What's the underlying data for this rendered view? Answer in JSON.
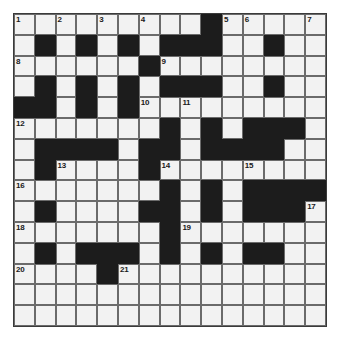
{
  "puzzle": {
    "type": "crossword-grid",
    "rows": 15,
    "columns": 15,
    "cell_size_px": 20.8,
    "grid_origin_px": {
      "x": 13,
      "y": 13
    },
    "colors": {
      "white_cell": "#f2f2f2",
      "black_cell": "#1c1c1c",
      "grid_line": "#6b6b6b",
      "border": "#3a3a3a",
      "number_text": "#1a1a1a",
      "page_background": "#ffffff"
    },
    "grid": [
      [
        "white",
        "white",
        "white",
        "white",
        "white",
        "white",
        "white",
        "white",
        "white",
        "black",
        "white",
        "white",
        "white",
        "white",
        "white"
      ],
      [
        "white",
        "black",
        "white",
        "black",
        "white",
        "black",
        "white",
        "black",
        "black",
        "black",
        "white",
        "white",
        "black",
        "white",
        "white"
      ],
      [
        "white",
        "white",
        "white",
        "white",
        "white",
        "white",
        "black",
        "white",
        "white",
        "white",
        "white",
        "white",
        "white",
        "white",
        "white"
      ],
      [
        "white",
        "black",
        "white",
        "black",
        "white",
        "black",
        "white",
        "black",
        "black",
        "black",
        "white",
        "white",
        "black",
        "white",
        "white"
      ],
      [
        "black",
        "black",
        "white",
        "black",
        "white",
        "black",
        "white",
        "white",
        "white",
        "white",
        "white",
        "white",
        "white",
        "white",
        "white"
      ],
      [
        "white",
        "white",
        "white",
        "white",
        "white",
        "white",
        "white",
        "black",
        "white",
        "black",
        "white",
        "black",
        "black",
        "black",
        "white"
      ],
      [
        "white",
        "black",
        "black",
        "black",
        "black",
        "white",
        "black",
        "black",
        "white",
        "black",
        "black",
        "black",
        "black",
        "white",
        "white"
      ],
      [
        "white",
        "black",
        "white",
        "white",
        "white",
        "white",
        "black",
        "white",
        "white",
        "white",
        "white",
        "white",
        "white",
        "white",
        "white"
      ],
      [
        "white",
        "white",
        "white",
        "white",
        "white",
        "white",
        "white",
        "black",
        "white",
        "black",
        "white",
        "black",
        "black",
        "black",
        "black"
      ],
      [
        "white",
        "black",
        "white",
        "white",
        "white",
        "white",
        "black",
        "black",
        "white",
        "black",
        "white",
        "black",
        "black",
        "black",
        "white"
      ],
      [
        "white",
        "white",
        "white",
        "white",
        "white",
        "white",
        "white",
        "black",
        "white",
        "white",
        "white",
        "white",
        "white",
        "white",
        "white"
      ],
      [
        "white",
        "black",
        "white",
        "black",
        "black",
        "black",
        "white",
        "black",
        "white",
        "black",
        "white",
        "black",
        "black",
        "white",
        "white"
      ],
      [
        "white",
        "white",
        "white",
        "white",
        "black",
        "white",
        "white",
        "white",
        "white",
        "white",
        "white",
        "white",
        "white",
        "white",
        "white"
      ],
      [
        "white",
        "white",
        "white",
        "white",
        "white",
        "white",
        "white",
        "white",
        "white",
        "white",
        "white",
        "white",
        "white",
        "white",
        "white"
      ],
      [
        "white",
        "white",
        "white",
        "white",
        "white",
        "white",
        "white",
        "white",
        "white",
        "white",
        "white",
        "white",
        "white",
        "white",
        "white"
      ]
    ],
    "numbers": [
      {
        "label": "1",
        "row": 0,
        "col": 0
      },
      {
        "label": "2",
        "row": 0,
        "col": 2
      },
      {
        "label": "3",
        "row": 0,
        "col": 4
      },
      {
        "label": "4",
        "row": 0,
        "col": 6
      },
      {
        "label": "5",
        "row": 0,
        "col": 10
      },
      {
        "label": "6",
        "row": 0,
        "col": 11
      },
      {
        "label": "7",
        "row": 0,
        "col": 14
      },
      {
        "label": "8",
        "row": 2,
        "col": 0
      },
      {
        "label": "9",
        "row": 2,
        "col": 7
      },
      {
        "label": "10",
        "row": 4,
        "col": 6
      },
      {
        "label": "11",
        "row": 4,
        "col": 8
      },
      {
        "label": "12",
        "row": 5,
        "col": 0
      },
      {
        "label": "13",
        "row": 7,
        "col": 2
      },
      {
        "label": "14",
        "row": 7,
        "col": 7
      },
      {
        "label": "15",
        "row": 7,
        "col": 11
      },
      {
        "label": "16",
        "row": 8,
        "col": 0
      },
      {
        "label": "17",
        "row": 9,
        "col": 14
      },
      {
        "label": "18",
        "row": 10,
        "col": 0
      },
      {
        "label": "19",
        "row": 10,
        "col": 8
      },
      {
        "label": "20",
        "row": 12,
        "col": 0
      },
      {
        "label": "21",
        "row": 12,
        "col": 5
      }
    ]
  }
}
